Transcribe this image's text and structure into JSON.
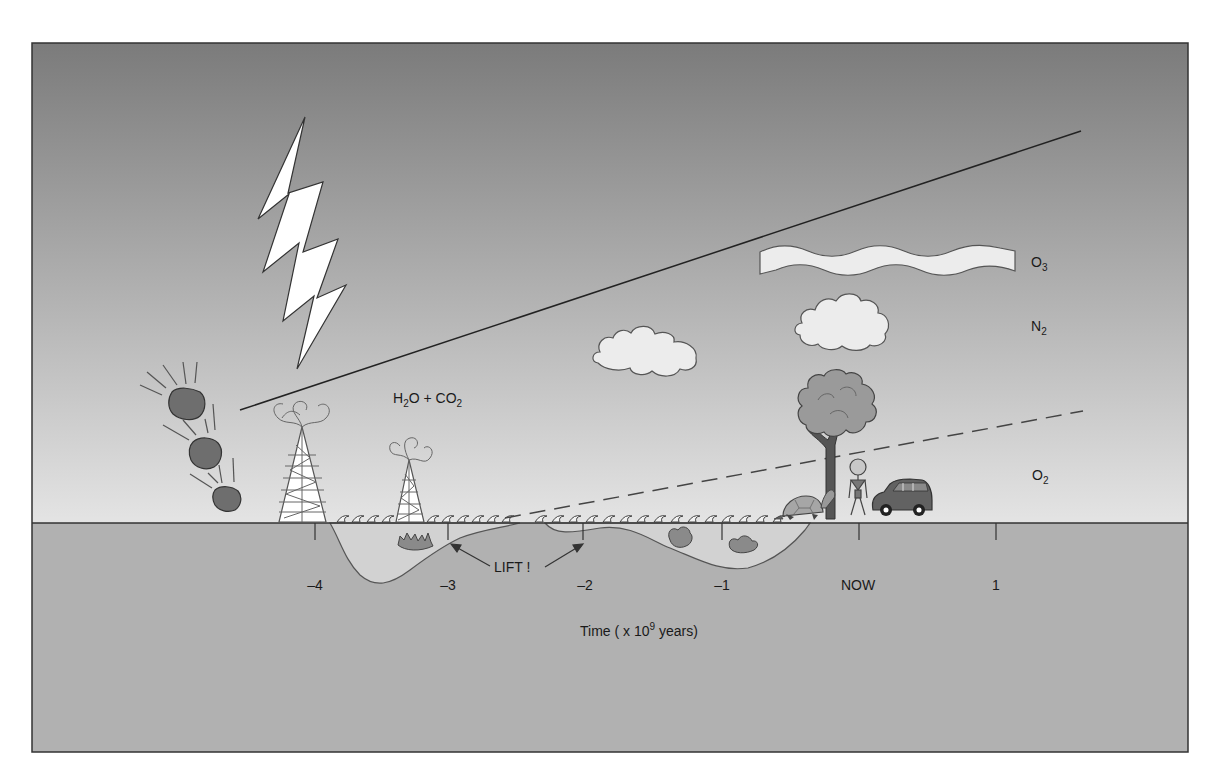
{
  "diagram": {
    "atmosphere_labels": {
      "o3": {
        "base": "O",
        "sub": "3"
      },
      "n2": {
        "base": "N",
        "sub": "2"
      },
      "o2": {
        "base": "O",
        "sub": "2"
      },
      "h2o_co2": {
        "p1": "H",
        "s1": "2",
        "p2": "O + CO",
        "s2": "2"
      }
    },
    "annotation": {
      "lift": "LIFT !"
    },
    "axis": {
      "ticks": [
        {
          "label": "–4",
          "x": 315
        },
        {
          "label": "–3",
          "x": 448
        },
        {
          "label": "–2",
          "x": 583
        },
        {
          "label": "–1",
          "x": 722
        },
        {
          "label": "NOW",
          "x": 859
        },
        {
          "label": "1",
          "x": 996
        }
      ],
      "title_pre": "Time ( x 10",
      "title_sup": "9",
      "title_post": " years)"
    },
    "lines": {
      "n2_solid": {
        "x1": 240,
        "y1": 410,
        "x2": 1081,
        "y2": 131
      },
      "o2_dashed": {
        "x1": 505,
        "y1": 518,
        "x2": 1083,
        "y2": 411
      }
    },
    "colors": {
      "sky_top": "#7b7b7b",
      "sky_bottom": "#e4e4e4",
      "ground": "#b1b1b1",
      "ocean": "#d2d2d2",
      "cloud": "#ececec",
      "meteor": "#6e6e6e",
      "car": "#626262",
      "tree_trunk": "#555555",
      "tree_canopy": "#9a9a9a",
      "outline": "#2a2a2a"
    },
    "objects": [
      "lightning-bolt",
      "meteorites",
      "volcano-towers",
      "clouds",
      "ozone-layer",
      "tree",
      "person",
      "car",
      "turtle",
      "stromatolites",
      "ocean-waves"
    ]
  }
}
